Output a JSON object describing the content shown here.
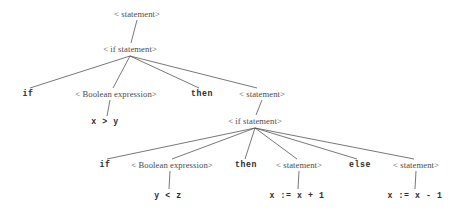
{
  "diagram": {
    "type": "parse-tree",
    "background_color": "#ffffff",
    "edge_color": "#555555",
    "nonterminal_color": "#4a4a4a",
    "terminal_color": "#2b2b2b",
    "nodes": [
      {
        "id": "n0",
        "label": "< statement>",
        "kind": "nonterminal",
        "x": 137,
        "y": 14
      },
      {
        "id": "n1",
        "label": "< if statement>",
        "kind": "nonterminal",
        "x": 130,
        "y": 49
      },
      {
        "id": "n2",
        "label": "if",
        "kind": "terminal",
        "x": 28,
        "y": 94
      },
      {
        "id": "n3",
        "label": "< Boolean expression>",
        "kind": "nonterminal",
        "x": 116,
        "y": 94
      },
      {
        "id": "n4",
        "label": "then",
        "kind": "terminal",
        "x": 202,
        "y": 94
      },
      {
        "id": "n5",
        "label": "< statement>",
        "kind": "nonterminal",
        "x": 262,
        "y": 94
      },
      {
        "id": "n6",
        "label": "x > y",
        "kind": "terminal",
        "x": 105,
        "y": 122
      },
      {
        "id": "n7",
        "label": "< if statement>",
        "kind": "nonterminal",
        "x": 255,
        "y": 121
      },
      {
        "id": "n8",
        "label": "if",
        "kind": "terminal",
        "x": 105,
        "y": 165
      },
      {
        "id": "n9",
        "label": "< Boolean expression>",
        "kind": "nonterminal",
        "x": 172,
        "y": 165
      },
      {
        "id": "n10",
        "label": "then",
        "kind": "terminal",
        "x": 246,
        "y": 165
      },
      {
        "id": "n11",
        "label": "< statement>",
        "kind": "nonterminal",
        "x": 299,
        "y": 165
      },
      {
        "id": "n12",
        "label": "else",
        "kind": "terminal",
        "x": 360,
        "y": 165
      },
      {
        "id": "n13",
        "label": "< statement>",
        "kind": "nonterminal",
        "x": 416,
        "y": 165
      },
      {
        "id": "n14",
        "label": "y < z",
        "kind": "terminal",
        "x": 168,
        "y": 196
      },
      {
        "id": "n15",
        "label": "x := x + 1",
        "kind": "terminal",
        "x": 297,
        "y": 196
      },
      {
        "id": "n16",
        "label": "x := x - 1",
        "kind": "terminal",
        "x": 415,
        "y": 196
      }
    ],
    "edges": [
      {
        "from": "n0",
        "to": "n1",
        "x1": 137,
        "y1": 20,
        "x2": 131,
        "y2": 43
      },
      {
        "from": "n1",
        "to": "n2",
        "x1": 130,
        "y1": 56,
        "x2": 30,
        "y2": 88
      },
      {
        "from": "n1",
        "to": "n3",
        "x1": 130,
        "y1": 56,
        "x2": 113,
        "y2": 88
      },
      {
        "from": "n1",
        "to": "n4",
        "x1": 130,
        "y1": 56,
        "x2": 199,
        "y2": 88
      },
      {
        "from": "n1",
        "to": "n5",
        "x1": 130,
        "y1": 56,
        "x2": 257,
        "y2": 88
      },
      {
        "from": "n3",
        "to": "n6",
        "x1": 110,
        "y1": 100,
        "x2": 107,
        "y2": 116
      },
      {
        "from": "n5",
        "to": "n7",
        "x1": 262,
        "y1": 100,
        "x2": 256,
        "y2": 115
      },
      {
        "from": "n7",
        "to": "n8",
        "x1": 255,
        "y1": 128,
        "x2": 107,
        "y2": 159
      },
      {
        "from": "n7",
        "to": "n9",
        "x1": 255,
        "y1": 128,
        "x2": 172,
        "y2": 159
      },
      {
        "from": "n7",
        "to": "n10",
        "x1": 255,
        "y1": 128,
        "x2": 245,
        "y2": 159
      },
      {
        "from": "n7",
        "to": "n11",
        "x1": 255,
        "y1": 128,
        "x2": 297,
        "y2": 159
      },
      {
        "from": "n7",
        "to": "n12",
        "x1": 255,
        "y1": 128,
        "x2": 357,
        "y2": 159
      },
      {
        "from": "n7",
        "to": "n13",
        "x1": 255,
        "y1": 128,
        "x2": 414,
        "y2": 159
      },
      {
        "from": "n9",
        "to": "n14",
        "x1": 170,
        "y1": 171,
        "x2": 169,
        "y2": 189
      },
      {
        "from": "n11",
        "to": "n15",
        "x1": 299,
        "y1": 171,
        "x2": 298,
        "y2": 189
      },
      {
        "from": "n13",
        "to": "n16",
        "x1": 416,
        "y1": 171,
        "x2": 415,
        "y2": 189
      }
    ]
  }
}
